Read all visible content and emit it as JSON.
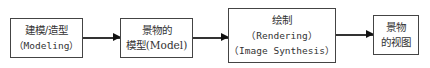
{
  "diagram": {
    "type": "flowchart",
    "nodes": [
      {
        "id": "modeling",
        "line1": "建模/造型",
        "line2": "（Modeling）"
      },
      {
        "id": "model",
        "line1": "景物的",
        "line2": "模型(Model)"
      },
      {
        "id": "rendering",
        "line1": "绘制",
        "line2": "（Rendering）",
        "line3": "（Image Synthesis）"
      },
      {
        "id": "view",
        "line1": "景物",
        "line2": "的视图"
      }
    ],
    "edges": [
      {
        "from": "modeling",
        "to": "model"
      },
      {
        "from": "model",
        "to": "rendering"
      },
      {
        "from": "rendering",
        "to": "view"
      }
    ]
  }
}
